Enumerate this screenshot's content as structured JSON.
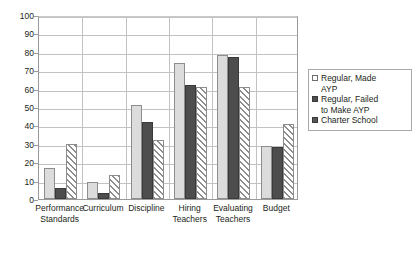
{
  "chart_data": {
    "type": "bar",
    "title": "",
    "subtitle": "",
    "xlabel": "",
    "ylabel": "",
    "ylim": [
      0,
      100
    ],
    "ytick_step": 10,
    "yticks": [
      0,
      10,
      20,
      30,
      40,
      50,
      60,
      70,
      80,
      90,
      100
    ],
    "ytick_labels": [
      "0",
      "10",
      "20",
      "30",
      "40",
      "50",
      "60",
      "70",
      "80",
      "90",
      "100"
    ],
    "grid": true,
    "grid_axis": "y",
    "legend_position": "right",
    "categories": [
      "Performance Standards",
      "Curriculum",
      "Discipline",
      "Hiring Teachers",
      "Evaluating Teachers",
      "Budget"
    ],
    "category_lines": [
      [
        "Performance",
        "Standards"
      ],
      [
        "Curriculum"
      ],
      [
        "Discipline"
      ],
      [
        "Hiring",
        "Teachers"
      ],
      [
        "Evaluating",
        "Teachers"
      ],
      [
        "Budget"
      ]
    ],
    "series": [
      {
        "name": "Regular, Made AYP",
        "style": "light-gray-solid",
        "color": "#dcdcdc",
        "values": [
          17,
          9,
          51,
          74,
          78,
          29
        ]
      },
      {
        "name": "Regular, Failed to Make AYP",
        "style": "dark-gray-solid",
        "color": "#4d4d4d",
        "values": [
          6,
          3.5,
          42,
          62,
          77,
          28
        ]
      },
      {
        "name": "Charter School",
        "style": "diagonal-hatch",
        "color": "#8d8d8d",
        "values": [
          30,
          13,
          32,
          61,
          61,
          41
        ]
      }
    ]
  },
  "legend": {
    "entries": [
      {
        "label_lines": [
          "Regular, Made",
          "AYP"
        ],
        "swatch": "light-gray-swatch"
      },
      {
        "label_lines": [
          "Regular, Failed",
          "to Make AYP"
        ],
        "swatch": "dark-gray-swatch"
      },
      {
        "label_lines": [
          "Charter School"
        ],
        "swatch": "hatched-swatch"
      }
    ]
  }
}
